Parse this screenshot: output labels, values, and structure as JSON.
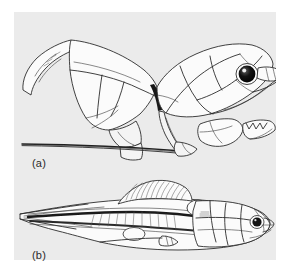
{
  "figure": {
    "background_color": "#ebebeb",
    "page_color": "#ffffff",
    "ink_color": "#2d2d2d",
    "panels": [
      {
        "id": "a",
        "label": "(a)",
        "subject": "armored fish head and thoracic shield, lateral view, facing right",
        "features": [
          "dorsal median plate",
          "pectoral spine curving forward and upward",
          "nuchal plate",
          "orbital plate with large dark eye",
          "rostral plate and snout",
          "lower jaw with toothed dental plates",
          "ventral plate series",
          "long tapering pectoral spine extending backward"
        ]
      },
      {
        "id": "b",
        "label": "(b)",
        "subject": "complete elongate fish with eel-like tail, lateral view, facing right",
        "features": [
          "armored head shield with plate sutures",
          "dark eye near snout",
          "dorsal fin with ray striations",
          "notochord / vertebral axis shading",
          "long tapering eel-like caudal region",
          "pectoral fin",
          "anal fin base"
        ]
      }
    ]
  },
  "labels": {
    "a": "(a)",
    "b": "(b)"
  }
}
